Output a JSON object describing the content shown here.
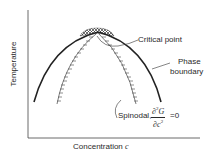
{
  "diagram": {
    "type": "phase-diagram",
    "axes": {
      "x_label": "Concentration",
      "x_symbol": "c",
      "y_label": "Temperature"
    },
    "curves": [
      {
        "name": "Phase boundary",
        "style": "solid-thick"
      },
      {
        "name": "Spinodal",
        "style": "hatched"
      }
    ],
    "labels": {
      "critical_point": "Critical point",
      "phase_boundary_line1": "Phase",
      "phase_boundary_line2": "boundary",
      "spinodal": "Spinodal,",
      "equation_numerator": "∂",
      "equation_num_sup": "2",
      "equation_num_var": "G",
      "equation_denominator": "∂c",
      "equation_den_sup": "2",
      "equation_rhs": "=0"
    },
    "colors": {
      "ink": "#2a2a2a",
      "background": "#ffffff"
    }
  }
}
